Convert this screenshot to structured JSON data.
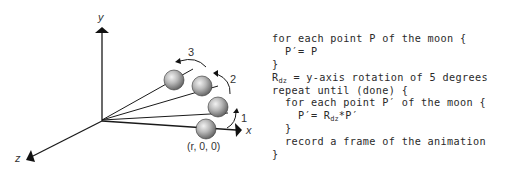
{
  "diagram": {
    "axes": {
      "x_label": "x",
      "y_label": "y",
      "z_label": "z"
    },
    "moon_positions": [
      {
        "id": "start",
        "label": "(r, 0, 0)"
      },
      {
        "id": "step1",
        "arrow_label": "1"
      },
      {
        "id": "step2",
        "arrow_label": "2"
      },
      {
        "id": "step3",
        "arrow_label": "3"
      }
    ],
    "start_label": "(r, 0, 0)",
    "step_labels": [
      "1",
      "2",
      "3"
    ],
    "colors": {
      "line": "#1a1a1a",
      "sphere_light": "#e6e6e6",
      "sphere_dark": "#6a6a6a",
      "text": "#2a2a2a"
    }
  },
  "code": {
    "lines": [
      {
        "indent": "",
        "text": "for each point P of the moon {"
      },
      {
        "indent": "  ",
        "text": "P′= P"
      },
      {
        "indent": "",
        "text": "}"
      },
      {
        "indent": "",
        "pre": "R",
        "sub": "dz",
        "text": " = y-axis rotation of 5 degrees"
      },
      {
        "indent": "",
        "text": "repeat until (done) {"
      },
      {
        "indent": "  ",
        "text": "for each point P′ of the moon {"
      },
      {
        "indent": "    ",
        "pre": "P′= R",
        "sub": "dz",
        "text": "*P′"
      },
      {
        "indent": "  ",
        "text": "}"
      },
      {
        "indent": "  ",
        "text": "record a frame of the animation"
      },
      {
        "indent": "",
        "text": "}"
      }
    ]
  }
}
